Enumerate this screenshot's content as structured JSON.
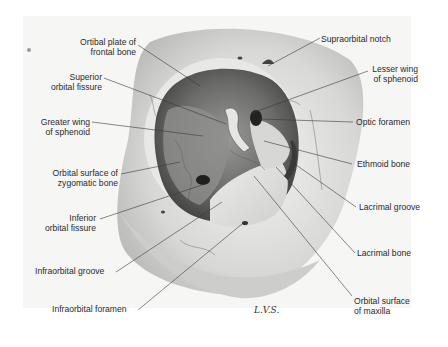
{
  "figure": {
    "signature": "L.V.S.",
    "labels_left": [
      {
        "id": "orbital-plate-frontal",
        "line1": "Ortibal plate of",
        "line2": "frontal bone"
      },
      {
        "id": "superior-orbital-fissure",
        "line1": "Superior",
        "line2": "orbital fissure"
      },
      {
        "id": "greater-wing-sphenoid",
        "line1": "Greater wing",
        "line2": "of sphenoid"
      },
      {
        "id": "orbital-surface-zygomatic",
        "line1": "Orbital surface of",
        "line2": "zygomatic bone"
      },
      {
        "id": "inferior-orbital-fissure",
        "line1": "Inferior",
        "line2": "orbital fissure"
      },
      {
        "id": "infraorbital-groove",
        "line1": "Infraorbital groove",
        "line2": ""
      },
      {
        "id": "infraorbital-foramen",
        "line1": "Infraorbital foramen",
        "line2": ""
      }
    ],
    "labels_right": [
      {
        "id": "supraorbital-notch",
        "line1": "Supraorbital notch",
        "line2": ""
      },
      {
        "id": "lesser-wing-sphenoid",
        "line1": "Lesser wing",
        "line2": "of sphenoid"
      },
      {
        "id": "optic-foramen",
        "line1": "Optic foramen",
        "line2": ""
      },
      {
        "id": "ethmoid-bone",
        "line1": "Ethmoid bone",
        "line2": ""
      },
      {
        "id": "lacrimal-groove",
        "line1": "Lacrimal groove",
        "line2": ""
      },
      {
        "id": "lacrimal-bone",
        "line1": "Lacrimal bone",
        "line2": ""
      },
      {
        "id": "orbital-surface-maxilla",
        "line1": "Orbital surface",
        "line2": "of maxilla"
      }
    ],
    "colors": {
      "background": "#ffffff",
      "panel": "#f6f6f5",
      "bone_light": "#e4e4e2",
      "orbit_dark": "#5a5a5a",
      "leader_line": "#3a3a3a",
      "text": "#2a2a2a"
    }
  }
}
